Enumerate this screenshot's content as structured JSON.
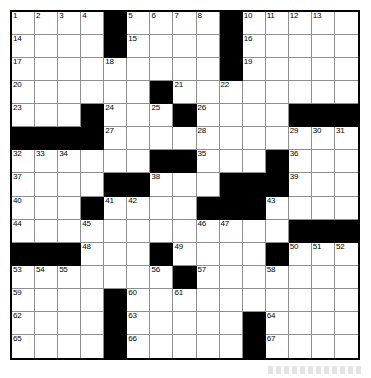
{
  "puzzle": {
    "type": "crossword-grid",
    "title": "",
    "columns": 15,
    "rows": 15,
    "colors": {
      "block": "#000000",
      "open": "#ffffff",
      "gridline": "#8f8f8f",
      "border": "#000000",
      "number_text": "#000000"
    },
    "blocked_cells": [
      [
        0,
        4
      ],
      [
        0,
        9
      ],
      [
        1,
        4
      ],
      [
        1,
        9
      ],
      [
        2,
        9
      ],
      [
        3,
        6
      ],
      [
        4,
        3
      ],
      [
        4,
        7
      ],
      [
        4,
        12
      ],
      [
        4,
        13
      ],
      [
        4,
        14
      ],
      [
        5,
        0
      ],
      [
        5,
        1
      ],
      [
        5,
        2
      ],
      [
        5,
        3
      ],
      [
        6,
        6
      ],
      [
        6,
        7
      ],
      [
        6,
        11
      ],
      [
        7,
        4
      ],
      [
        7,
        5
      ],
      [
        7,
        9
      ],
      [
        7,
        10
      ],
      [
        7,
        11
      ],
      [
        8,
        3
      ],
      [
        8,
        8
      ],
      [
        8,
        9
      ],
      [
        8,
        10
      ],
      [
        9,
        12
      ],
      [
        9,
        13
      ],
      [
        9,
        14
      ],
      [
        10,
        0
      ],
      [
        10,
        1
      ],
      [
        10,
        2
      ],
      [
        10,
        6
      ],
      [
        10,
        11
      ],
      [
        11,
        7
      ],
      [
        12,
        4
      ],
      [
        13,
        4
      ],
      [
        13,
        10
      ],
      [
        14,
        4
      ],
      [
        14,
        10
      ]
    ],
    "numbered_cells": [
      {
        "number": "1",
        "row": 0,
        "col": 0
      },
      {
        "number": "2",
        "row": 0,
        "col": 1
      },
      {
        "number": "3",
        "row": 0,
        "col": 2
      },
      {
        "number": "4",
        "row": 0,
        "col": 3
      },
      {
        "number": "5",
        "row": 0,
        "col": 5
      },
      {
        "number": "6",
        "row": 0,
        "col": 6
      },
      {
        "number": "7",
        "row": 0,
        "col": 7
      },
      {
        "number": "8",
        "row": 0,
        "col": 8
      },
      {
        "number": "9",
        "row": 0,
        "col": 9
      },
      {
        "number": "10",
        "row": 0,
        "col": 10
      },
      {
        "number": "11",
        "row": 0,
        "col": 11
      },
      {
        "number": "12",
        "row": 0,
        "col": 12
      },
      {
        "number": "13",
        "row": 0,
        "col": 13
      },
      {
        "number": "14",
        "row": 1,
        "col": 0
      },
      {
        "number": "15",
        "row": 1,
        "col": 5
      },
      {
        "number": "16",
        "row": 1,
        "col": 10
      },
      {
        "number": "17",
        "row": 2,
        "col": 0
      },
      {
        "number": "18",
        "row": 2,
        "col": 4
      },
      {
        "number": "19",
        "row": 2,
        "col": 10
      },
      {
        "number": "20",
        "row": 3,
        "col": 0
      },
      {
        "number": "21",
        "row": 3,
        "col": 7
      },
      {
        "number": "22",
        "row": 3,
        "col": 9
      },
      {
        "number": "23",
        "row": 4,
        "col": 0
      },
      {
        "number": "24",
        "row": 4,
        "col": 4
      },
      {
        "number": "25",
        "row": 4,
        "col": 6
      },
      {
        "number": "26",
        "row": 4,
        "col": 8
      },
      {
        "number": "27",
        "row": 5,
        "col": 4
      },
      {
        "number": "28",
        "row": 5,
        "col": 8
      },
      {
        "number": "29",
        "row": 5,
        "col": 12
      },
      {
        "number": "30",
        "row": 5,
        "col": 13
      },
      {
        "number": "31",
        "row": 5,
        "col": 14
      },
      {
        "number": "32",
        "row": 6,
        "col": 0
      },
      {
        "number": "33",
        "row": 6,
        "col": 1
      },
      {
        "number": "34",
        "row": 6,
        "col": 2
      },
      {
        "number": "35",
        "row": 6,
        "col": 8
      },
      {
        "number": "36",
        "row": 6,
        "col": 12
      },
      {
        "number": "37",
        "row": 7,
        "col": 0
      },
      {
        "number": "38",
        "row": 7,
        "col": 6
      },
      {
        "number": "39",
        "row": 7,
        "col": 12
      },
      {
        "number": "40",
        "row": 8,
        "col": 0
      },
      {
        "number": "41",
        "row": 8,
        "col": 4
      },
      {
        "number": "42",
        "row": 8,
        "col": 5
      },
      {
        "number": "43",
        "row": 8,
        "col": 11
      },
      {
        "number": "44",
        "row": 9,
        "col": 0
      },
      {
        "number": "45",
        "row": 9,
        "col": 3
      },
      {
        "number": "46",
        "row": 9,
        "col": 8
      },
      {
        "number": "47",
        "row": 9,
        "col": 9
      },
      {
        "number": "48",
        "row": 10,
        "col": 3
      },
      {
        "number": "49",
        "row": 10,
        "col": 7
      },
      {
        "number": "50",
        "row": 10,
        "col": 12
      },
      {
        "number": "51",
        "row": 10,
        "col": 13
      },
      {
        "number": "52",
        "row": 10,
        "col": 14
      },
      {
        "number": "53",
        "row": 11,
        "col": 0
      },
      {
        "number": "54",
        "row": 11,
        "col": 1
      },
      {
        "number": "55",
        "row": 11,
        "col": 2
      },
      {
        "number": "56",
        "row": 11,
        "col": 6
      },
      {
        "number": "57",
        "row": 11,
        "col": 8
      },
      {
        "number": "58",
        "row": 11,
        "col": 11
      },
      {
        "number": "59",
        "row": 12,
        "col": 0
      },
      {
        "number": "60",
        "row": 12,
        "col": 5
      },
      {
        "number": "61",
        "row": 12,
        "col": 7
      },
      {
        "number": "62",
        "row": 13,
        "col": 0
      },
      {
        "number": "63",
        "row": 13,
        "col": 5
      },
      {
        "number": "64",
        "row": 13,
        "col": 11
      },
      {
        "number": "65",
        "row": 14,
        "col": 0
      },
      {
        "number": "66",
        "row": 14,
        "col": 5
      },
      {
        "number": "67",
        "row": 14,
        "col": 11
      }
    ]
  }
}
